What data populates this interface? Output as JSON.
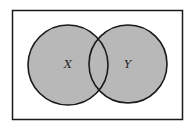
{
  "diagram": {
    "type": "venn",
    "sets": [
      {
        "label": "X",
        "shaded": true
      },
      {
        "label": "Y",
        "shaded": true
      }
    ],
    "fill_color": "#b8b8b8",
    "stroke_color": "#1a1a1a",
    "background": "#ffffff"
  }
}
